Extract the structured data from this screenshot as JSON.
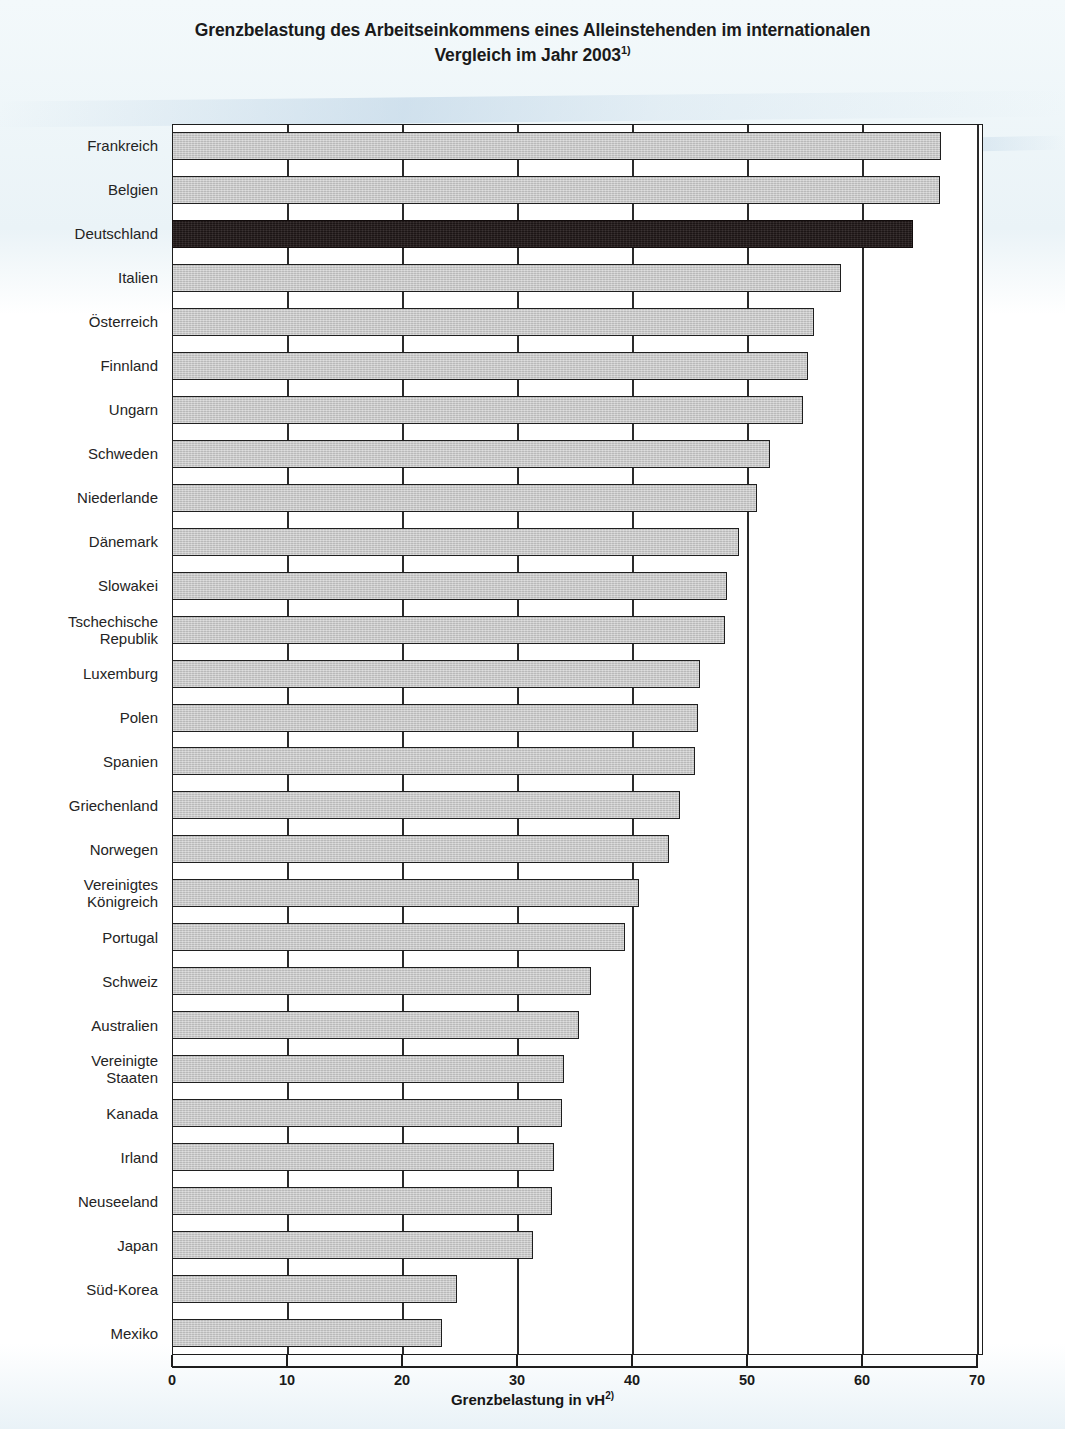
{
  "title": {
    "line1": "Grenzbelastung des Arbeitseinkommens eines Alleinstehenden im internationalen",
    "line2": "Vergleich im Jahr 2003",
    "footnote_marker": "1)"
  },
  "axis": {
    "x_title_text": "Grenzbelastung in vH",
    "x_title_footnote": "2)",
    "x_ticks": [
      "0",
      "10",
      "20",
      "30",
      "40",
      "50",
      "60",
      "70"
    ]
  },
  "colors": {
    "bar_fill": "#c6c6c6",
    "bar_highlight_fill": "#241b1b",
    "bar_outline": "#1f1f1f",
    "axis": "#1d1d1d",
    "plot_background": "#ffffff",
    "page_background": "#eef5f8"
  },
  "chart_data": {
    "type": "bar",
    "orientation": "horizontal",
    "title": "Grenzbelastung des Arbeitseinkommens eines Alleinstehenden im internationalen Vergleich im Jahr 2003",
    "xlabel": "Grenzbelastung in vH",
    "ylabel": "",
    "xlim": [
      0,
      70
    ],
    "xticks": [
      0,
      10,
      20,
      30,
      40,
      50,
      60,
      70
    ],
    "grid": "vertical",
    "legend": "none",
    "highlight_category": "Deutschland",
    "categories": [
      "Frankreich",
      "Belgien",
      "Deutschland",
      "Italien",
      "Österreich",
      "Finnland",
      "Ungarn",
      "Schweden",
      "Niederlande",
      "Dänemark",
      "Slowakei",
      "Tschechische\nRepublik",
      "Luxemburg",
      "Polen",
      "Spanien",
      "Griechenland",
      "Norwegen",
      "Vereinigtes\nKönigreich",
      "Portugal",
      "Schweiz",
      "Australien",
      "Vereinigte\nStaaten",
      "Kanada",
      "Irland",
      "Neuseeland",
      "Japan",
      "Süd-Korea",
      "Mexiko"
    ],
    "values": [
      66.9,
      66.8,
      64.4,
      58.2,
      55.8,
      55.3,
      54.9,
      52.0,
      50.9,
      49.3,
      48.3,
      48.1,
      45.9,
      45.7,
      45.5,
      44.2,
      43.2,
      40.6,
      39.4,
      36.4,
      35.4,
      34.1,
      33.9,
      33.2,
      33.0,
      31.4,
      24.8,
      23.5
    ]
  }
}
